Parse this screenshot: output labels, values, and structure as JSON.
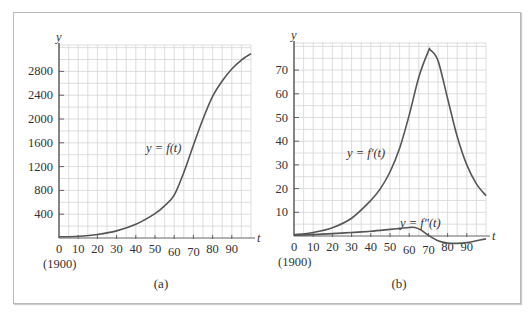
{
  "chart_data": [
    {
      "panel": "a",
      "type": "line",
      "caption": "(a)",
      "title": "",
      "xlabel": "t",
      "ylabel": "y",
      "x_origin_note": "(1900)",
      "xlim": [
        0,
        100
      ],
      "ylim": [
        0,
        3200
      ],
      "xticks": [
        0,
        10,
        20,
        30,
        40,
        50,
        60,
        70,
        80,
        90
      ],
      "yticks": [
        400,
        800,
        1200,
        1600,
        2000,
        2400,
        2800
      ],
      "grid": true,
      "series": [
        {
          "name": "y = f(t)",
          "label_pos": [
            46,
            1520
          ],
          "x": [
            0,
            10,
            20,
            30,
            40,
            50,
            55,
            60,
            65,
            70,
            75,
            80,
            85,
            90,
            95,
            100
          ],
          "values": [
            20,
            30,
            60,
            120,
            230,
            410,
            540,
            720,
            1100,
            1560,
            2000,
            2380,
            2640,
            2840,
            2990,
            3100
          ]
        }
      ]
    },
    {
      "panel": "b",
      "type": "line",
      "caption": "(b)",
      "title": "",
      "xlabel": "t",
      "ylabel": "y",
      "x_origin_note": "(1900)",
      "xlim": [
        0,
        100
      ],
      "ylim": [
        -3,
        80
      ],
      "xticks": [
        0,
        10,
        20,
        30,
        40,
        50,
        60,
        70,
        80,
        90
      ],
      "yticks": [
        10,
        20,
        30,
        40,
        50,
        60,
        70
      ],
      "grid": true,
      "series": [
        {
          "name": "y = f'(t)",
          "label_pos": [
            28,
            50
          ],
          "x": [
            0,
            10,
            20,
            30,
            40,
            45,
            50,
            55,
            60,
            65,
            70,
            71,
            75,
            80,
            85,
            90,
            95,
            100
          ],
          "values": [
            0.5,
            1.5,
            3.5,
            7.5,
            15,
            20,
            27,
            37,
            51,
            67,
            78,
            78.5,
            74,
            58,
            42,
            30,
            22,
            17
          ]
        },
        {
          "name": "y = f''(t)",
          "label_pos": [
            55,
            5
          ],
          "x": [
            0,
            10,
            20,
            30,
            40,
            50,
            55,
            60,
            63,
            66,
            70,
            75,
            80,
            85,
            90,
            95,
            100
          ],
          "values": [
            0.3,
            0.6,
            1.0,
            1.5,
            2.0,
            2.8,
            3.2,
            3.6,
            3.6,
            2.6,
            0.3,
            -2.0,
            -3.0,
            -3.1,
            -2.8,
            -2.0,
            -1.2
          ]
        }
      ]
    }
  ],
  "labels": {
    "a_f": "y = f(t)",
    "b_fp": "y = f′(t)",
    "b_fpp": "y = f″(t)",
    "origin_year": "(1900)",
    "caption_a": "(a)",
    "caption_b": "(b)",
    "y_axis": "y",
    "t_axis": "t"
  }
}
